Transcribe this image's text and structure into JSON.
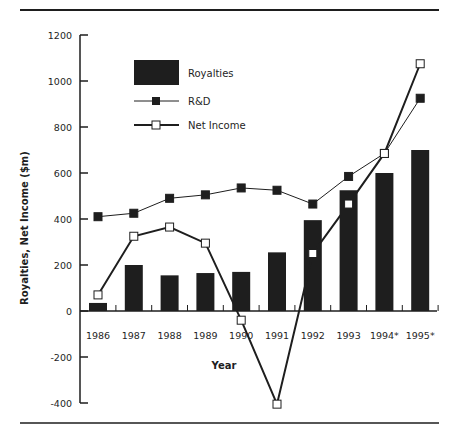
{
  "chart_data": {
    "type": "bar",
    "title": "",
    "xlabel": "Year",
    "ylabel": "Royalties, Net Income ($m)",
    "ylim": [
      -400,
      1200
    ],
    "yticks": [
      1200,
      1000,
      800,
      600,
      400,
      200,
      0,
      -200,
      -400
    ],
    "ytick_labels": [
      "1200",
      "1000",
      "800",
      "600",
      "400",
      "200",
      "0",
      "-200",
      "-400"
    ],
    "grid": false,
    "legend_position": "upper-left",
    "categories": [
      "1986",
      "1987",
      "1988",
      "1989",
      "1990",
      "1991",
      "1992",
      "1993",
      "1994*",
      "1995*"
    ],
    "series": [
      {
        "name": "Royalties",
        "type": "bar",
        "color": "#1e1e1e",
        "values": [
          35,
          200,
          155,
          165,
          170,
          255,
          395,
          525,
          600,
          700
        ]
      },
      {
        "name": "R&D",
        "type": "line",
        "marker": "filled-square",
        "color": "#1e1e1e",
        "values": [
          410,
          425,
          490,
          505,
          535,
          525,
          465,
          585,
          685,
          925
        ]
      },
      {
        "name": "Net Income",
        "type": "line",
        "marker": "hollow-square",
        "color": "#1e1e1e",
        "values": [
          70,
          325,
          365,
          295,
          -40,
          -405,
          250,
          465,
          685,
          1075
        ]
      }
    ]
  },
  "legend": {
    "items": [
      {
        "label": "Royalties"
      },
      {
        "label": "R&D"
      },
      {
        "label": "Net Income"
      }
    ]
  }
}
